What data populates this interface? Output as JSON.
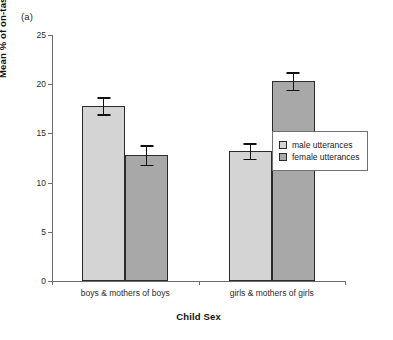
{
  "panel_label": "(a)",
  "legend": {
    "position": "right-middle",
    "entries": [
      {
        "label": "male utterances",
        "color": "#d4d4d4",
        "swatch_name": "legend-swatch-male"
      },
      {
        "label": "female utterances",
        "color": "#a8a8a8",
        "swatch_name": "legend-swatch-female"
      }
    ]
  },
  "chart_data": {
    "type": "bar",
    "title": "",
    "subtitle": "",
    "panel_label": "(a)",
    "xlabel": "Child Sex",
    "ylabel": "Mean % of on-task utterances",
    "categories": [
      "boys & mothers of boys",
      "girls & mothers of girls"
    ],
    "series": [
      {
        "name": "male utterances",
        "color": "#d4d4d4",
        "values": [
          17.8,
          13.2
        ],
        "errors": [
          0.85,
          0.8
        ]
      },
      {
        "name": "female utterances",
        "color": "#a8a8a8",
        "values": [
          12.8,
          20.3
        ],
        "errors": [
          1.0,
          0.9
        ]
      }
    ],
    "ylim": [
      0,
      25
    ],
    "yticks": [
      0,
      5,
      10,
      15,
      20,
      25
    ],
    "ytick_labels": [
      "0",
      "5",
      "10",
      "15",
      "20",
      "25"
    ],
    "grid": false,
    "error_bar_type": "standard error",
    "legend_position": "right"
  }
}
